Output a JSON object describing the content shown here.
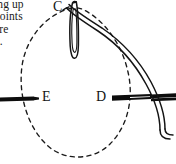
{
  "figure": {
    "name": "embroidery-stitch-diagram",
    "background_color": "#ffffff",
    "ink_color": "#111111",
    "caption_text": {
      "line1": "ing up",
      "line2": "points",
      "line3": "are",
      "line4": "d."
    },
    "point_labels": {
      "c": "C",
      "e": "E",
      "d": "D"
    },
    "elements": {
      "dashed_loop_name": "dashed-thread-loop",
      "needle_vertical_name": "vertical-needle",
      "needle_left_name": "left-needle-bar",
      "needle_right_name": "right-needle-bar",
      "thread_name": "thread-double-line"
    }
  }
}
